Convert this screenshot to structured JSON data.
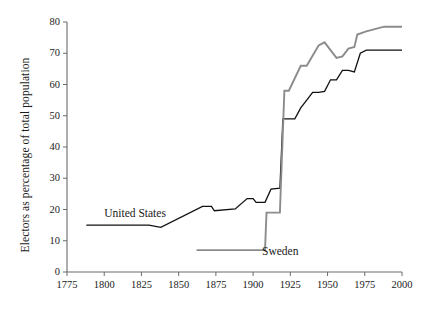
{
  "chart_data": {
    "type": "line",
    "title": "",
    "xlabel": "",
    "ylabel": "Electors as percentage of total population",
    "xlim": [
      1775,
      2000
    ],
    "ylim": [
      0,
      80
    ],
    "xticks": [
      1775,
      1800,
      1825,
      1850,
      1875,
      1900,
      1925,
      1950,
      1975,
      2000
    ],
    "yticks": [
      0,
      10,
      20,
      30,
      40,
      50,
      60,
      70,
      80
    ],
    "grid": false,
    "legend_position": "inline-annotation",
    "series": [
      {
        "name": "United States",
        "color": "#111111",
        "label_x": 1800,
        "label_y": 18.5,
        "points": [
          [
            1788,
            15.0
          ],
          [
            1830,
            15.0
          ],
          [
            1838,
            14.3
          ],
          [
            1866,
            21.0
          ],
          [
            1872,
            21.0
          ],
          [
            1874,
            19.6
          ],
          [
            1888,
            20.2
          ],
          [
            1896,
            23.5
          ],
          [
            1900,
            23.5
          ],
          [
            1902,
            22.3
          ],
          [
            1908,
            22.3
          ],
          [
            1912,
            26.5
          ],
          [
            1918,
            26.8
          ],
          [
            1920,
            49.0
          ],
          [
            1928,
            49.0
          ],
          [
            1932,
            52.5
          ],
          [
            1940,
            57.5
          ],
          [
            1944,
            57.5
          ],
          [
            1948,
            57.8
          ],
          [
            1952,
            61.5
          ],
          [
            1956,
            61.5
          ],
          [
            1960,
            64.5
          ],
          [
            1964,
            64.5
          ],
          [
            1968,
            64.0
          ],
          [
            1972,
            70.0
          ],
          [
            1976,
            71.0
          ],
          [
            1996,
            71.0
          ],
          [
            2000,
            71.0
          ]
        ]
      },
      {
        "name": "Sweden",
        "color": "#8c8c8c",
        "label_x": 1906,
        "label_y": 6.3,
        "points": [
          [
            1862,
            7.0
          ],
          [
            1908,
            7.0
          ],
          [
            1909,
            19.0
          ],
          [
            1918,
            19.0
          ],
          [
            1921,
            58.0
          ],
          [
            1924,
            58.0
          ],
          [
            1932,
            66.0
          ],
          [
            1936,
            66.0
          ],
          [
            1944,
            72.5
          ],
          [
            1948,
            73.5
          ],
          [
            1952,
            71.0
          ],
          [
            1956,
            68.5
          ],
          [
            1960,
            69.0
          ],
          [
            1964,
            71.5
          ],
          [
            1968,
            72.0
          ],
          [
            1970,
            76.0
          ],
          [
            1976,
            77.0
          ],
          [
            1988,
            78.5
          ],
          [
            1992,
            78.5
          ],
          [
            2000,
            78.5
          ]
        ]
      }
    ]
  },
  "axis": {
    "y_title": "Electors as percentage of total population",
    "yticks": [
      "0",
      "10",
      "20",
      "30",
      "40",
      "50",
      "60",
      "70",
      "80"
    ],
    "xticks": [
      "1775",
      "1800",
      "1825",
      "1850",
      "1875",
      "1900",
      "1925",
      "1950",
      "1975",
      "2000"
    ]
  },
  "labels": {
    "united_states": "United States",
    "sweden": "Sweden"
  },
  "colors": {
    "united_states": "#111111",
    "sweden": "#8c8c8c",
    "axis": "#6b6b6b",
    "background": "#ffffff"
  }
}
